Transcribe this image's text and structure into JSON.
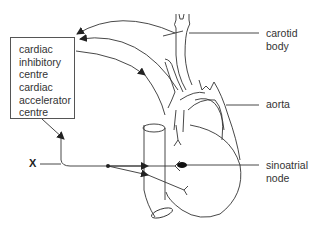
{
  "diagram": {
    "box": {
      "inhibitory": [
        "cardiac",
        "inhibitory",
        "centre"
      ],
      "accelerator": [
        "cardiac",
        "accelerator",
        "centre"
      ]
    },
    "labels": {
      "carotid": [
        "carotid",
        "body"
      ],
      "aorta": "aorta",
      "sinoatrial": [
        "sinoatrial",
        "node"
      ],
      "x": "X"
    },
    "colors": {
      "line": "#333333",
      "text": "#333333"
    }
  }
}
